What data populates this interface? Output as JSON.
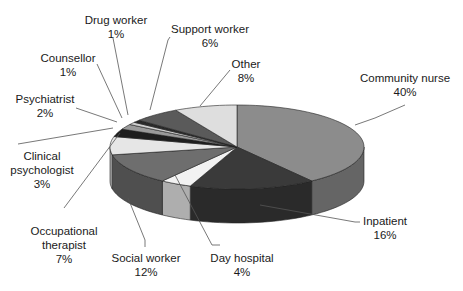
{
  "chart_data": {
    "type": "pie",
    "style": "3d",
    "title": "",
    "start": "top",
    "direction": "clockwise",
    "categories": [
      "Community nurse",
      "Inpatient",
      "Day hospital",
      "Social worker",
      "Occupational therapist",
      "Clinical psychologist",
      "Psychiatrist",
      "Counsellor",
      "Drug worker",
      "Support worker",
      "Other"
    ],
    "values": [
      40,
      16,
      4,
      12,
      7,
      3,
      2,
      1,
      1,
      6,
      8
    ],
    "value_labels": [
      "40%",
      "16%",
      "4%",
      "12%",
      "7%",
      "3%",
      "2%",
      "1%",
      "1%",
      "6%",
      "8%"
    ],
    "label_lines": [
      [
        "Community nurse"
      ],
      [
        "Inpatient"
      ],
      [
        "Day hospital"
      ],
      [
        "Social worker"
      ],
      [
        "Occupational",
        "therapist"
      ],
      [
        "Clinical",
        "psychologist"
      ],
      [
        "Psychiatrist"
      ],
      [
        "Counsellor"
      ],
      [
        "Drug worker"
      ],
      [
        "Support worker"
      ],
      [
        "Other"
      ]
    ],
    "colors": [
      "#8c8c8c",
      "#3a3a3a",
      "#f2f2f2",
      "#6e6e6e",
      "#e6e6e6",
      "#1e1e1e",
      "#9a9a9a",
      "#cfcfcf",
      "#2a2a2a",
      "#5a5a5a",
      "#dedede"
    ],
    "legend": "none"
  }
}
